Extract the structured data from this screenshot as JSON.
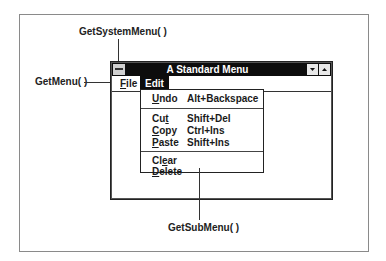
{
  "callouts": {
    "system_menu": "GetSystemMenu( )",
    "menu": "GetMenu( )",
    "sub_menu": "GetSubMenu( )"
  },
  "window": {
    "title": "A Standard Menu",
    "system_menu_icon": "system-menu-icon",
    "minimize_icon": "triangle-down",
    "maximize_icon": "triangle-up"
  },
  "menubar": {
    "items": [
      {
        "label": "File",
        "mnemonic_index": 0,
        "active": false
      },
      {
        "label": "Edit",
        "mnemonic_index": -1,
        "active": true
      }
    ]
  },
  "dropdown": {
    "groups": [
      [
        {
          "label": "Undo",
          "shortcut": "Alt+Backspace",
          "mnemonic_index": 0
        }
      ],
      [
        {
          "label": "Cut",
          "shortcut": "Shift+Del",
          "mnemonic_index": 2
        },
        {
          "label": "Copy",
          "shortcut": "Ctrl+Ins",
          "mnemonic_index": 0
        },
        {
          "label": "Paste",
          "shortcut": "Shift+Ins",
          "mnemonic_index": 0
        }
      ],
      [
        {
          "label": "Clear",
          "shortcut": "",
          "mnemonic_index": 2
        },
        {
          "label": "Delete",
          "shortcut": "",
          "mnemonic_index": 0
        }
      ]
    ]
  }
}
